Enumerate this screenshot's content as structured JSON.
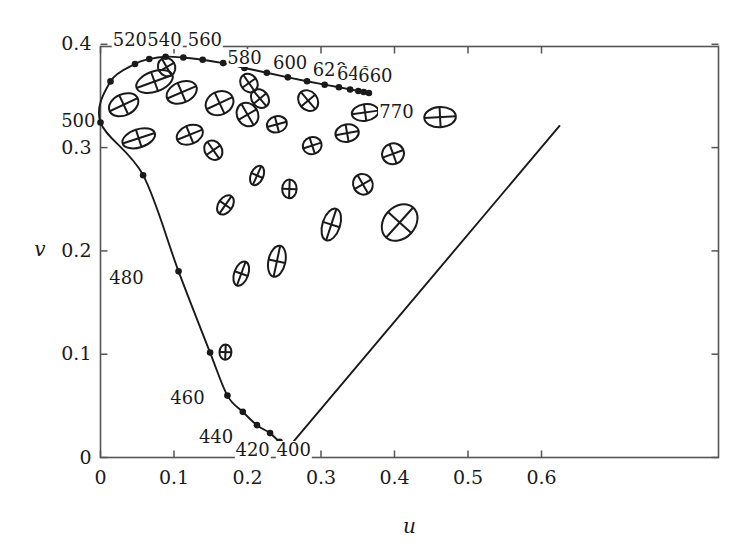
{
  "figure": {
    "name": "MacAdam ellipses in CIE 1960 UCS chromaticity diagram",
    "background": "#ffffff",
    "ink": "#1a1a1a"
  },
  "axes": {
    "x_title": "u",
    "y_title": "v",
    "x_ticks": [
      "0",
      "0.1",
      "0.2",
      "0.3",
      "0.4",
      "0.5",
      "0.6"
    ],
    "x_tick_values": [
      0,
      0.1,
      0.2,
      0.3,
      0.4,
      0.5,
      0.6
    ],
    "y_ticks": [
      "0",
      "0.1",
      "0.2",
      "0.3",
      "0.4"
    ],
    "y_tick_values": [
      0,
      0.1,
      0.2,
      0.3,
      0.4
    ],
    "x_range": [
      -0.01,
      0.655
    ],
    "y_range": [
      -0.012,
      0.413
    ]
  },
  "chart_data": {
    "type": "scatter",
    "title": "",
    "xlabel": "u",
    "ylabel": "v",
    "xlim": [
      -0.01,
      0.655
    ],
    "ylim": [
      -0.012,
      0.413
    ],
    "grid": false,
    "legend": "none",
    "series": [
      {
        "name": "spectral locus",
        "marker": "filled-circle",
        "points": [
          {
            "wavelength": 400,
            "u": 0.2559,
            "v": 0.0099
          },
          {
            "wavelength": 420,
            "u": 0.2437,
            "v": 0.0151
          },
          {
            "wavelength": 430,
            "u": 0.2307,
            "v": 0.0236
          },
          {
            "wavelength": 440,
            "u": 0.2128,
            "v": 0.0313
          },
          {
            "wavelength": 450,
            "u": 0.1936,
            "v": 0.0442
          },
          {
            "wavelength": 460,
            "u": 0.1727,
            "v": 0.0599
          },
          {
            "wavelength": 470,
            "u": 0.1491,
            "v": 0.1016
          },
          {
            "wavelength": 480,
            "u": 0.1062,
            "v": 0.1802
          },
          {
            "wavelength": 490,
            "u": 0.058,
            "v": 0.2733
          },
          {
            "wavelength": 500,
            "u": 0.0,
            "v": 0.3243
          },
          {
            "wavelength": 510,
            "u": 0.0136,
            "v": 0.3641
          },
          {
            "wavelength": 520,
            "u": 0.0469,
            "v": 0.3809
          },
          {
            "wavelength": 530,
            "u": 0.0663,
            "v": 0.3857
          },
          {
            "wavelength": 540,
            "u": 0.0886,
            "v": 0.388
          },
          {
            "wavelength": 550,
            "u": 0.1127,
            "v": 0.3872
          },
          {
            "wavelength": 560,
            "u": 0.139,
            "v": 0.3851
          },
          {
            "wavelength": 570,
            "u": 0.1669,
            "v": 0.3818
          },
          {
            "wavelength": 580,
            "u": 0.1958,
            "v": 0.3771
          },
          {
            "wavelength": 590,
            "u": 0.2263,
            "v": 0.3725
          },
          {
            "wavelength": 600,
            "u": 0.2549,
            "v": 0.368
          },
          {
            "wavelength": 610,
            "u": 0.281,
            "v": 0.3642
          },
          {
            "wavelength": 620,
            "u": 0.305,
            "v": 0.3609
          },
          {
            "wavelength": 630,
            "u": 0.3244,
            "v": 0.3584
          },
          {
            "wavelength": 640,
            "u": 0.3396,
            "v": 0.3563
          },
          {
            "wavelength": 650,
            "u": 0.3508,
            "v": 0.3548
          },
          {
            "wavelength": 660,
            "u": 0.3582,
            "v": 0.3538
          },
          {
            "wavelength": 770,
            "u": 0.3652,
            "v": 0.3528
          }
        ]
      }
    ],
    "wavelength_labels": [
      {
        "text": "520",
        "u": 0.04,
        "v": 0.402
      },
      {
        "text": "540",
        "u": 0.087,
        "v": 0.402
      },
      {
        "text": "560",
        "u": 0.142,
        "v": 0.402
      },
      {
        "text": "580",
        "u": 0.196,
        "v": 0.385
      },
      {
        "text": "600",
        "u": 0.258,
        "v": 0.38
      },
      {
        "text": "620",
        "u": 0.312,
        "v": 0.373
      },
      {
        "text": "640",
        "u": 0.345,
        "v": 0.369
      },
      {
        "text": "660",
        "u": 0.374,
        "v": 0.367
      },
      {
        "text": "770",
        "u": 0.378,
        "v": 0.333
      },
      {
        "text": "500",
        "u": -0.01,
        "v": 0.324
      },
      {
        "text": "480",
        "u": 0.06,
        "v": 0.172
      },
      {
        "text": "460",
        "u": 0.143,
        "v": 0.056
      },
      {
        "text": "440",
        "u": 0.182,
        "v": 0.018
      },
      {
        "text": "420",
        "u": 0.207,
        "v": 0.005
      },
      {
        "text": "400",
        "u": 0.263,
        "v": 0.005
      }
    ],
    "purple_line": {
      "from": {
        "u": 0.2559,
        "v": 0.0099
      },
      "to": {
        "u": 0.6245,
        "v": 0.321
      }
    },
    "ellipses_note": "MacAdam just-noticeable-difference ellipses, drawn with their two principal axes as an inscribed cross; sizes exaggerated ~10x",
    "ellipses": [
      {
        "u": 0.0735,
        "v": 0.364,
        "a": 0.026,
        "b": 0.0098,
        "angle": 20
      },
      {
        "u": 0.0315,
        "v": 0.3415,
        "a": 0.021,
        "b": 0.0102,
        "angle": 25
      },
      {
        "u": 0.1105,
        "v": 0.3535,
        "a": 0.0215,
        "b": 0.01,
        "angle": 23
      },
      {
        "u": 0.162,
        "v": 0.343,
        "a": 0.0195,
        "b": 0.0112,
        "angle": 25
      },
      {
        "u": 0.2,
        "v": 0.332,
        "a": 0.0142,
        "b": 0.0118,
        "angle": 30
      },
      {
        "u": 0.052,
        "v": 0.309,
        "a": 0.023,
        "b": 0.0088,
        "angle": 18
      },
      {
        "u": 0.1215,
        "v": 0.3125,
        "a": 0.0185,
        "b": 0.009,
        "angle": 22
      },
      {
        "u": 0.1535,
        "v": 0.2975,
        "a": 0.0115,
        "b": 0.01,
        "angle": 35
      },
      {
        "u": 0.217,
        "v": 0.3475,
        "a": 0.0112,
        "b": 0.0098,
        "angle": 40
      },
      {
        "u": 0.2825,
        "v": 0.3455,
        "a": 0.0125,
        "b": 0.0108,
        "angle": 40
      },
      {
        "u": 0.24,
        "v": 0.3225,
        "a": 0.0138,
        "b": 0.0078,
        "angle": 15
      },
      {
        "u": 0.288,
        "v": 0.302,
        "a": 0.013,
        "b": 0.0082,
        "angle": 18
      },
      {
        "u": 0.36,
        "v": 0.334,
        "a": 0.0182,
        "b": 0.008,
        "angle": 8
      },
      {
        "u": 0.3355,
        "v": 0.314,
        "a": 0.016,
        "b": 0.0085,
        "angle": 10
      },
      {
        "u": 0.398,
        "v": 0.294,
        "a": 0.015,
        "b": 0.01,
        "angle": 20
      },
      {
        "u": 0.462,
        "v": 0.3295,
        "a": 0.0215,
        "b": 0.0098,
        "angle": 3
      },
      {
        "u": 0.357,
        "v": 0.2645,
        "a": 0.0132,
        "b": 0.0102,
        "angle": 30
      },
      {
        "u": 0.407,
        "v": 0.2275,
        "a": 0.0275,
        "b": 0.0152,
        "angle": 48
      },
      {
        "u": 0.314,
        "v": 0.2255,
        "a": 0.0225,
        "b": 0.0085,
        "angle": 72
      },
      {
        "u": 0.257,
        "v": 0.26,
        "a": 0.0128,
        "b": 0.007,
        "angle": 88
      },
      {
        "u": 0.213,
        "v": 0.273,
        "a": 0.014,
        "b": 0.006,
        "angle": 66
      },
      {
        "u": 0.17,
        "v": 0.2445,
        "a": 0.0145,
        "b": 0.0068,
        "angle": 55
      },
      {
        "u": 0.24,
        "v": 0.19,
        "a": 0.0215,
        "b": 0.0082,
        "angle": 78
      },
      {
        "u": 0.1915,
        "v": 0.178,
        "a": 0.0172,
        "b": 0.0068,
        "angle": 70
      },
      {
        "u": 0.17,
        "v": 0.102,
        "a": 0.0105,
        "b": 0.0058,
        "angle": 88
      },
      {
        "u": 0.202,
        "v": 0.3625,
        "a": 0.0112,
        "b": 0.0095,
        "angle": 35
      },
      {
        "u": 0.09,
        "v": 0.378,
        "a": 0.0115,
        "b": 0.0092,
        "angle": 30
      }
    ]
  }
}
